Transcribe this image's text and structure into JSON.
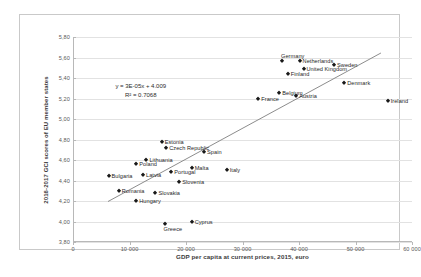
{
  "chart_data": {
    "type": "scatter",
    "title": "",
    "xlabel": "GDP per capita at current prices, 2015, euro",
    "ylabel": "2016-2017 GCI scores of EU member states",
    "xlim": [
      0,
      60000
    ],
    "ylim": [
      3.8,
      5.8
    ],
    "grid": true,
    "legend": false,
    "x_ticks": [
      "0",
      "10 000",
      "20 000",
      "30 000",
      "40 000",
      "50 000",
      "60 000"
    ],
    "x_tick_values": [
      0,
      10000,
      20000,
      30000,
      40000,
      50000,
      60000
    ],
    "y_ticks": [
      "3,80",
      "4,00",
      "4,20",
      "4,40",
      "4,60",
      "4,80",
      "5,00",
      "5,20",
      "5,40",
      "5,60",
      "5,80"
    ],
    "y_tick_values": [
      3.8,
      4.0,
      4.2,
      4.4,
      4.6,
      4.8,
      5.0,
      5.2,
      5.4,
      5.6,
      5.8
    ],
    "annotations": {
      "equation": "y = 3E-05x + 4.009",
      "r_squared": "R² = 0.7068"
    },
    "trendline": {
      "slope": 3e-05,
      "intercept": 4.009,
      "x_start": 6200,
      "x_end": 54500
    },
    "points": [
      {
        "label": "Germany",
        "x": 37000,
        "y": 5.57,
        "label_pos": "above"
      },
      {
        "label": "Netherlands",
        "x": 40100,
        "y": 5.57,
        "label_pos": "right"
      },
      {
        "label": "United Kingdom",
        "x": 40800,
        "y": 5.49,
        "label_pos": "right"
      },
      {
        "label": "Sweden",
        "x": 46200,
        "y": 5.53,
        "label_pos": "right"
      },
      {
        "label": "Finland",
        "x": 38000,
        "y": 5.44,
        "label_pos": "right"
      },
      {
        "label": "Denmark",
        "x": 48000,
        "y": 5.35,
        "label_pos": "right"
      },
      {
        "label": "Belgium",
        "x": 36500,
        "y": 5.25,
        "label_pos": "right"
      },
      {
        "label": "Austria",
        "x": 39500,
        "y": 5.22,
        "label_pos": "right"
      },
      {
        "label": "France",
        "x": 32800,
        "y": 5.2,
        "label_pos": "right"
      },
      {
        "label": "Ireland",
        "x": 55700,
        "y": 5.18,
        "label_pos": "right"
      },
      {
        "label": "Estonia",
        "x": 15700,
        "y": 4.78,
        "label_pos": "right"
      },
      {
        "label": "Czech Republic",
        "x": 16500,
        "y": 4.72,
        "label_pos": "right"
      },
      {
        "label": "Spain",
        "x": 23200,
        "y": 4.68,
        "label_pos": "right"
      },
      {
        "label": "Lithuania",
        "x": 13000,
        "y": 4.6,
        "label_pos": "right"
      },
      {
        "label": "Poland",
        "x": 11200,
        "y": 4.56,
        "label_pos": "right"
      },
      {
        "label": "Malta",
        "x": 21000,
        "y": 4.52,
        "label_pos": "right"
      },
      {
        "label": "Italy",
        "x": 27200,
        "y": 4.5,
        "label_pos": "right"
      },
      {
        "label": "Portugal",
        "x": 17400,
        "y": 4.48,
        "label_pos": "right"
      },
      {
        "label": "Latvia",
        "x": 12400,
        "y": 4.45,
        "label_pos": "right"
      },
      {
        "label": "Bulgaria",
        "x": 6300,
        "y": 4.44,
        "label_pos": "right"
      },
      {
        "label": "Slovenia",
        "x": 18800,
        "y": 4.39,
        "label_pos": "right"
      },
      {
        "label": "Slovakia",
        "x": 14600,
        "y": 4.28,
        "label_pos": "right"
      },
      {
        "label": "Romania",
        "x": 8100,
        "y": 4.3,
        "label_pos": "right"
      },
      {
        "label": "Hungary",
        "x": 11200,
        "y": 4.2,
        "label_pos": "right"
      },
      {
        "label": "Cyprus",
        "x": 21000,
        "y": 4.0,
        "label_pos": "right"
      },
      {
        "label": "Greece",
        "x": 16200,
        "y": 3.98,
        "label_pos": "below"
      }
    ]
  },
  "colors": {
    "marker": "#1a1a1a",
    "grid": "#e2e2e2",
    "axis": "#b8b8b8",
    "frame": "#c9c9c9",
    "trendline": "#7f7f7f",
    "background": "#ffffff"
  }
}
